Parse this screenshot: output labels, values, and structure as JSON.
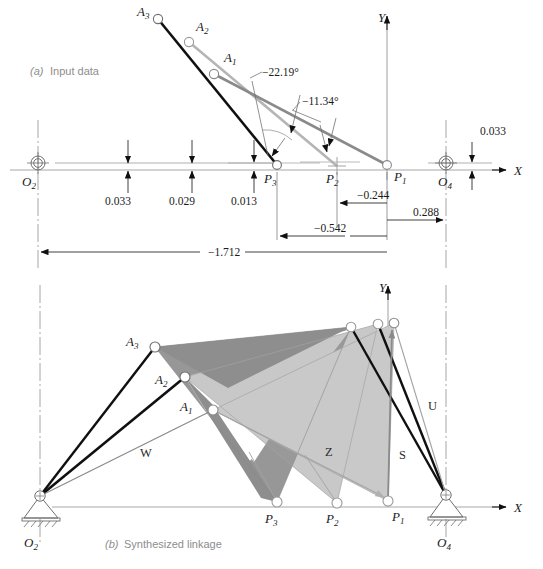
{
  "figure": {
    "captions": {
      "a_prefix": "(a)",
      "a_text": "Input data",
      "b_prefix": "(b)",
      "b_text": "Synthesized linkage"
    },
    "axis_labels": {
      "x": "X",
      "y": "Y"
    }
  },
  "colors": {
    "black": "#101010",
    "mid_gray": "#8a8a8a",
    "light_gray": "#b5b5b5",
    "axis_gray": "#a8a8a8",
    "tri_light": "#c9c9c9",
    "tri_mid": "#9a9a9a",
    "tri_dark": "#8e8e8e",
    "caption_gray": "#8d8d8d",
    "thin_line": "#6e6e6e"
  },
  "input_data": {
    "points": [
      {
        "id": "O2",
        "base": "O",
        "sub": "2",
        "x": 38,
        "y": 163,
        "label_x": 22,
        "label_y": 186
      },
      {
        "id": "O4",
        "base": "O",
        "sub": "4",
        "x": 446,
        "y": 163,
        "label_x": 438,
        "label_y": 186
      },
      {
        "id": "P1",
        "base": "P",
        "sub": "1",
        "x": 387,
        "y": 165,
        "label_x": 394,
        "label_y": 181
      },
      {
        "id": "P2",
        "base": "P",
        "sub": "2",
        "x": 337,
        "y": 166,
        "label_x": 326,
        "label_y": 183
      },
      {
        "id": "P3",
        "base": "P",
        "sub": "3",
        "x": 277,
        "y": 165,
        "label_x": 264,
        "label_y": 183
      },
      {
        "id": "A1",
        "base": "A",
        "sub": "1",
        "x": 214,
        "y": 74,
        "label_x": 224,
        "label_y": 62
      },
      {
        "id": "A2",
        "base": "A",
        "sub": "2",
        "x": 189,
        "y": 42,
        "label_x": 196,
        "label_y": 31
      },
      {
        "id": "A3",
        "base": "A",
        "sub": "3",
        "x": 158,
        "y": 19,
        "label_x": 137,
        "label_y": 16
      }
    ],
    "angles": [
      {
        "value": "−22.19°",
        "text_x": 262,
        "text_y": 76
      },
      {
        "value": "−11.34°",
        "text_x": 302,
        "text_y": 105
      }
    ],
    "dimensions": [
      {
        "value": "0.033",
        "text_x": 105,
        "text_y": 205,
        "type": "vertical-pair"
      },
      {
        "value": "0.029",
        "text_x": 169,
        "text_y": 205,
        "type": "vertical-pair"
      },
      {
        "value": "0.013",
        "text_x": 231,
        "text_y": 205,
        "type": "vertical-pair"
      },
      {
        "value": "0.033",
        "text_x": 480,
        "text_y": 135,
        "type": "vertical-pair"
      },
      {
        "value": "−0.244",
        "text_x": 357,
        "text_y": 199,
        "type": "horizontal"
      },
      {
        "value": "0.288",
        "text_x": 413,
        "text_y": 216,
        "type": "horizontal"
      },
      {
        "value": "−0.542",
        "text_x": 314,
        "text_y": 232,
        "type": "horizontal"
      },
      {
        "value": "−1.712",
        "text_x": 208,
        "text_y": 256,
        "type": "horizontal"
      }
    ]
  },
  "synthesized_linkage": {
    "points": [
      {
        "id": "O2",
        "base": "O",
        "sub": "2",
        "x": 40,
        "y": 496,
        "label_x": 24,
        "label_y": 525
      },
      {
        "id": "O4",
        "base": "O",
        "sub": "4",
        "x": 446,
        "y": 495,
        "label_x": 437,
        "label_y": 524
      },
      {
        "id": "P1",
        "base": "P",
        "sub": "1",
        "x": 388,
        "y": 501,
        "label_x": 392,
        "label_y": 521
      },
      {
        "id": "P2",
        "base": "P",
        "sub": "2",
        "x": 337,
        "y": 503,
        "label_x": 326,
        "label_y": 523
      },
      {
        "id": "P3",
        "base": "P",
        "sub": "3",
        "x": 277,
        "y": 502,
        "label_x": 265,
        "label_y": 523
      },
      {
        "id": "A1",
        "base": "A",
        "sub": "1",
        "x": 213,
        "y": 410,
        "label_x": 180,
        "label_y": 411
      },
      {
        "id": "A2",
        "base": "A",
        "sub": "2",
        "x": 185,
        "y": 377,
        "label_x": 155,
        "label_y": 384
      },
      {
        "id": "A3",
        "base": "A",
        "sub": "3",
        "x": 155,
        "y": 347,
        "label_x": 126,
        "label_y": 346
      },
      {
        "id": "B1",
        "base": "B",
        "sub": "1",
        "x": 394,
        "y": 323,
        "label_x": 0,
        "label_y": 0
      },
      {
        "id": "B2",
        "base": "B",
        "sub": "2",
        "x": 378,
        "y": 324,
        "label_x": 0,
        "label_y": 0
      },
      {
        "id": "B3",
        "base": "B",
        "sub": "3",
        "x": 351,
        "y": 327,
        "label_x": 0,
        "label_y": 0
      }
    ],
    "vector_labels": [
      {
        "name": "W",
        "x": 140,
        "y": 457
      },
      {
        "name": "Z",
        "x": 325,
        "y": 456
      },
      {
        "name": "S",
        "x": 399,
        "y": 459
      },
      {
        "name": "U",
        "x": 428,
        "y": 410
      }
    ]
  }
}
